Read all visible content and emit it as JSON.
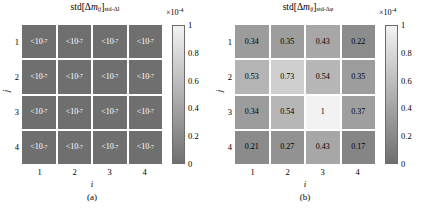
{
  "figure": {
    "colormap": {
      "low_color": "#6f6f6f",
      "high_color": "#f2f2f2",
      "name": "gray"
    }
  },
  "chart_data": [
    {
      "type": "heatmap",
      "panel": "a",
      "caption": "(a)",
      "title_prefix": "std[",
      "title_delta": "Δ",
      "title_m": "m",
      "title_ij": "ij",
      "title_close": "]",
      "title_sub": "std-Δl",
      "xlabel": "i",
      "ylabel": "j",
      "xticks": [
        "1",
        "2",
        "3",
        "4"
      ],
      "yticks": [
        "1",
        "2",
        "3",
        "4"
      ],
      "cbar_multiplier_base": "×10",
      "cbar_multiplier_exp": "-4",
      "cbar_ticks": [
        "1",
        "0.8",
        "0.6",
        "0.4",
        "0.2",
        "0"
      ],
      "clim": [
        0,
        1
      ],
      "cell_text_color": "#ffffff",
      "cells": [
        [
          {
            "label_lt": "<10",
            "label_exp": "-7",
            "value": 0
          },
          {
            "label_lt": "<10",
            "label_exp": "-7",
            "value": 0
          },
          {
            "label_lt": "<10",
            "label_exp": "-7",
            "value": 0
          },
          {
            "label_lt": "<10",
            "label_exp": "-7",
            "value": 0
          }
        ],
        [
          {
            "label_lt": "<10",
            "label_exp": "-7",
            "value": 0
          },
          {
            "label_lt": "<10",
            "label_exp": "-7",
            "value": 0
          },
          {
            "label_lt": "<10",
            "label_exp": "-7",
            "value": 0
          },
          {
            "label_lt": "<10",
            "label_exp": "-7",
            "value": 0
          }
        ],
        [
          {
            "label_lt": "<10",
            "label_exp": "-7",
            "value": 0
          },
          {
            "label_lt": "<10",
            "label_exp": "-7",
            "value": 0
          },
          {
            "label_lt": "<10",
            "label_exp": "-7",
            "value": 0
          },
          {
            "label_lt": "<10",
            "label_exp": "-7",
            "value": 0
          }
        ],
        [
          {
            "label_lt": "<10",
            "label_exp": "-7",
            "value": 0
          },
          {
            "label_lt": "<10",
            "label_exp": "-7",
            "value": 0
          },
          {
            "label_lt": "<10",
            "label_exp": "-7",
            "value": 0
          },
          {
            "label_lt": "<10",
            "label_exp": "-7",
            "value": 0
          }
        ]
      ]
    },
    {
      "type": "heatmap",
      "panel": "b",
      "caption": "(b)",
      "title_prefix": "std[",
      "title_delta": "Δ",
      "title_m": "m",
      "title_ij": "ij",
      "title_close": "]",
      "title_sub": "std-Δφ",
      "xlabel": "i",
      "ylabel": "j",
      "xticks": [
        "1",
        "2",
        "3",
        "4"
      ],
      "yticks": [
        "1",
        "2",
        "3",
        "4"
      ],
      "cbar_multiplier_base": "×10",
      "cbar_multiplier_exp": "-4",
      "cbar_ticks": [
        "1",
        "0.8",
        "0.6",
        "0.4",
        "0.2",
        "0"
      ],
      "clim": [
        0,
        1
      ],
      "cell_text_color": "#000000",
      "cells": [
        [
          {
            "label": "0.34",
            "value": 0.34
          },
          {
            "label": "0.35",
            "value": 0.35
          },
          {
            "label": "0.43",
            "value": 0.43
          },
          {
            "label": "0.22",
            "value": 0.22
          }
        ],
        [
          {
            "label": "0.53",
            "value": 0.53
          },
          {
            "label": "0.73",
            "value": 0.73
          },
          {
            "label": "0.54",
            "value": 0.54
          },
          {
            "label": "0.35",
            "value": 0.35
          }
        ],
        [
          {
            "label": "0.34",
            "value": 0.34
          },
          {
            "label": "0.54",
            "value": 0.54
          },
          {
            "label": "1",
            "value": 1
          },
          {
            "label": "0.37",
            "value": 0.37
          }
        ],
        [
          {
            "label": "0.21",
            "value": 0.21
          },
          {
            "label": "0.27",
            "value": 0.27
          },
          {
            "label": "0.43",
            "value": 0.43
          },
          {
            "label": "0.17",
            "value": 0.17
          }
        ]
      ]
    }
  ]
}
